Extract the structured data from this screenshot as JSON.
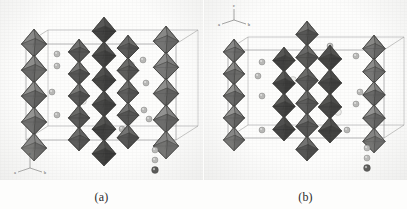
{
  "figure": {
    "type": "crystal-structure-figure",
    "background_color": "#fdfdfc",
    "panels": [
      {
        "id": "a",
        "caption": "(a)",
        "axis_indicator": {
          "up_label": "c",
          "left_label": "a",
          "right_label": "b"
        },
        "columns": 4,
        "legend_spheres": 3
      },
      {
        "id": "b",
        "caption": "(b)",
        "axis_indicator": {
          "up_label": "c",
          "left_label": "a",
          "right_label": "b"
        },
        "columns": 4,
        "legend_spheres": 3
      }
    ]
  },
  "colors": {
    "polyhedron_light": "#b4b4b2",
    "polyhedron_mid": "#8f8f8d",
    "polyhedron_dark": "#6c6c6a",
    "polyhedron_darkest": "#575755",
    "edge": "#3d3d3b",
    "cell_edge": "#7b7b79",
    "atom_light": "#f0f0ee",
    "atom_mid": "#b9b9b7",
    "atom_dark": "#4a4a48",
    "caption_text": "#2b2b2b"
  },
  "chart_data": {
    "type": "diagram",
    "title": "",
    "xlabel": "",
    "ylabel": "",
    "panels": [
      {
        "label": "(a)",
        "description": "Polyhedral crystal structure view: corner-sharing octahedral chains running along c within an outlined unit cell, interstitial cation spheres between chains.",
        "octahedral_columns": [
          {
            "x": 34,
            "top": 30,
            "bottom": 160,
            "units": 5,
            "shade": "light"
          },
          {
            "x": 79,
            "top": 40,
            "bottom": 150,
            "units": 5,
            "shade": "mid"
          },
          {
            "x": 104,
            "top": 18,
            "bottom": 165,
            "units": 6,
            "shade": "dark"
          },
          {
            "x": 128,
            "top": 36,
            "bottom": 148,
            "units": 5,
            "shade": "mid"
          },
          {
            "x": 166,
            "top": 27,
            "bottom": 158,
            "units": 5,
            "shade": "light"
          }
        ],
        "unit_cell": {
          "front_top_y": 44,
          "front_bottom_y": 140,
          "left_x": 26,
          "right_x": 176,
          "depth_dx": 22,
          "depth_dy": -14
        },
        "atoms": [
          {
            "x": 57,
            "y": 54,
            "r": 3.0,
            "shade": "mid"
          },
          {
            "x": 57,
            "y": 66,
            "r": 3.0,
            "shade": "mid"
          },
          {
            "x": 52,
            "y": 92,
            "r": 3.0,
            "shade": "mid"
          },
          {
            "x": 57,
            "y": 115,
            "r": 3.0,
            "shade": "mid"
          },
          {
            "x": 80,
            "y": 70,
            "r": 3.4,
            "shade": "light"
          },
          {
            "x": 83,
            "y": 101,
            "r": 3.4,
            "shade": "light"
          },
          {
            "x": 131,
            "y": 65,
            "r": 3.4,
            "shade": "light"
          },
          {
            "x": 143,
            "y": 60,
            "r": 3.0,
            "shade": "mid"
          },
          {
            "x": 146,
            "y": 83,
            "r": 3.0,
            "shade": "mid"
          },
          {
            "x": 144,
            "y": 110,
            "r": 3.0,
            "shade": "mid"
          },
          {
            "x": 149,
            "y": 119,
            "r": 3.0,
            "shade": "mid"
          },
          {
            "x": 122,
            "y": 129,
            "r": 3.0,
            "shade": "mid"
          }
        ],
        "legend": {
          "x": 155,
          "y0": 150,
          "spacing": 10,
          "spheres": [
            "mid",
            "mid",
            "dark"
          ]
        },
        "axis_origin": {
          "x": 30,
          "y": 168
        }
      },
      {
        "label": "(b)",
        "description": "Polyhedral crystal structure view rotated: edge-sharing and corner-sharing octahedral slabs within the unit cell, interstitial cation spheres.",
        "octahedral_columns": [
          {
            "x": 30,
            "top": 40,
            "bottom": 150,
            "units": 5,
            "shade": "light"
          },
          {
            "x": 80,
            "top": 48,
            "bottom": 140,
            "units": 4,
            "shade": "dark"
          },
          {
            "x": 103,
            "top": 22,
            "bottom": 160,
            "units": 6,
            "shade": "mid"
          },
          {
            "x": 126,
            "top": 46,
            "bottom": 142,
            "units": 4,
            "shade": "dark"
          },
          {
            "x": 170,
            "top": 36,
            "bottom": 152,
            "units": 5,
            "shade": "light"
          }
        ],
        "unit_cell": {
          "front_top_y": 50,
          "front_bottom_y": 138,
          "left_x": 24,
          "right_x": 180,
          "depth_dx": 20,
          "depth_dy": -13
        },
        "atoms": [
          {
            "x": 58,
            "y": 62,
            "r": 3.0,
            "shade": "mid"
          },
          {
            "x": 54,
            "y": 76,
            "r": 3.0,
            "shade": "mid"
          },
          {
            "x": 58,
            "y": 96,
            "r": 3.0,
            "shade": "mid"
          },
          {
            "x": 58,
            "y": 130,
            "r": 3.0,
            "shade": "mid"
          },
          {
            "x": 89,
            "y": 80,
            "r": 3.4,
            "shade": "light"
          },
          {
            "x": 134,
            "y": 112,
            "r": 3.4,
            "shade": "light"
          },
          {
            "x": 126,
            "y": 46,
            "r": 3.0,
            "shade": "mid"
          },
          {
            "x": 152,
            "y": 56,
            "r": 3.0,
            "shade": "mid"
          },
          {
            "x": 156,
            "y": 92,
            "r": 3.0,
            "shade": "mid"
          },
          {
            "x": 152,
            "y": 104,
            "r": 3.0,
            "shade": "mid"
          },
          {
            "x": 143,
            "y": 130,
            "r": 3.0,
            "shade": "mid"
          }
        ],
        "legend": {
          "x": 163,
          "y0": 148,
          "spacing": 10,
          "spheres": [
            "mid",
            "mid",
            "dark"
          ]
        },
        "axis_origin": {
          "x": 30,
          "y": 20
        }
      }
    ]
  }
}
